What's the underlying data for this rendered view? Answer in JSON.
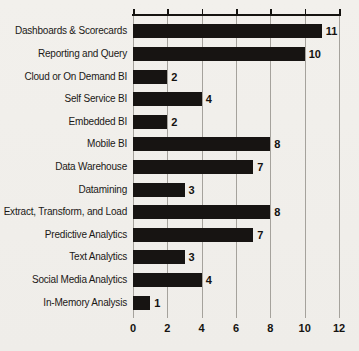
{
  "chart_data": {
    "type": "bar",
    "orientation": "horizontal",
    "title": "",
    "xlabel": "",
    "ylabel": "",
    "categories": [
      "Dashboards & Scorecards",
      "Reporting and Query",
      "Cloud or On Demand BI",
      "Self Service BI",
      "Embedded BI",
      "Mobile BI",
      "Data Warehouse",
      "Datamining",
      "Extract, Transform, and Load",
      "Predictive Analytics",
      "Text Analytics",
      "Social Media Analytics",
      "In-Memory Analysis"
    ],
    "values": [
      11,
      10,
      2,
      4,
      2,
      8,
      7,
      3,
      8,
      7,
      3,
      4,
      1
    ],
    "xticks": [
      0,
      2,
      4,
      6,
      8,
      10,
      12
    ],
    "xlim": [
      0,
      12
    ],
    "grid": "vertical gridlines at each x tick",
    "axis_position": "ticks and axis line on top, tick labels on bottom",
    "legend": "none",
    "colors": {
      "bar": "#171412",
      "background": "#f1efeb",
      "gridline": "#a5a29c",
      "axis_line": "#151310",
      "text": "#1b1916"
    }
  }
}
